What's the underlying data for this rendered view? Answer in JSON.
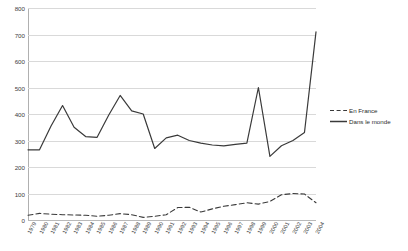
{
  "chart_data": {
    "type": "line",
    "title": "",
    "xlabel": "",
    "ylabel": "",
    "ylim": [
      0,
      800
    ],
    "ytick_step": 100,
    "grid": true,
    "legend_position": "right",
    "x": [
      "1979",
      "1980",
      "1981",
      "1982",
      "1983",
      "1984",
      "1985",
      "1986",
      "1987",
      "1988",
      "1989",
      "1990",
      "1991",
      "1992",
      "1993",
      "1994",
      "1995",
      "1996",
      "1997",
      "1998",
      "1999",
      "2000",
      "2001",
      "2002",
      "2003",
      "2004"
    ],
    "yticks": [
      "0",
      "100",
      "200",
      "300",
      "400",
      "500",
      "600",
      "700",
      "800"
    ],
    "series": [
      {
        "name": "En France",
        "style": "dashed",
        "color": "#3a3a3a",
        "values": [
          18,
          25,
          22,
          20,
          19,
          18,
          14,
          18,
          24,
          20,
          10,
          14,
          20,
          47,
          48,
          30,
          42,
          52,
          58,
          65,
          60,
          70,
          95,
          100,
          98,
          65
        ]
      },
      {
        "name": "Dans le monde",
        "style": "solid",
        "color": "#3a3a3a",
        "values": [
          265,
          265,
          355,
          432,
          350,
          315,
          312,
          395,
          470,
          412,
          400,
          270,
          310,
          320,
          300,
          290,
          283,
          280,
          285,
          290,
          500,
          240,
          280,
          300,
          330,
          710
        ]
      }
    ]
  },
  "legend": {
    "items": [
      {
        "label": "En France",
        "style": "dashed"
      },
      {
        "label": "Dans le monde",
        "style": "solid"
      }
    ]
  }
}
